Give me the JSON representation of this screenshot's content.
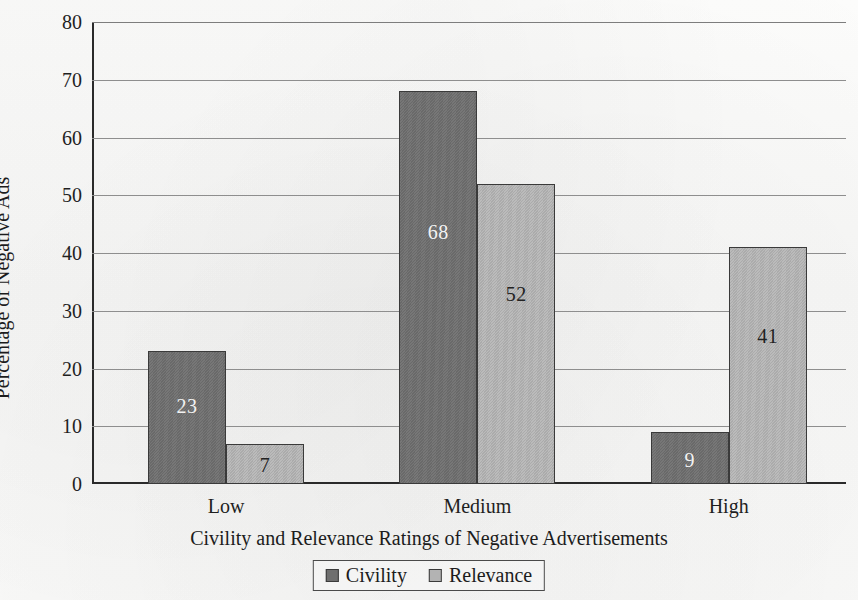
{
  "chart_data": {
    "type": "bar",
    "title": "",
    "xlabel": "Civility and Relevance Ratings of Negative Advertisements",
    "ylabel": "Percentage of Negative Ads",
    "categories": [
      "Low",
      "Medium",
      "High"
    ],
    "series": [
      {
        "name": "Civility",
        "values": [
          23,
          68,
          9
        ],
        "color": "#6f6f6f"
      },
      {
        "name": "Relevance",
        "values": [
          7,
          52,
          41
        ],
        "color": "#b3b3b3"
      }
    ],
    "ylim": [
      0,
      80
    ],
    "ytick_values": [
      0,
      10,
      20,
      30,
      40,
      50,
      60,
      70,
      80
    ],
    "ytick_labels": [
      "0",
      "10",
      "20",
      "30",
      "40",
      "50",
      "60",
      "70",
      "80"
    ],
    "grid": true,
    "grid_axis": "y",
    "legend_position": "bottom",
    "data_labels": {
      "shown": true,
      "Civility": [
        "23",
        "68",
        "9"
      ],
      "Relevance": [
        "7",
        "52",
        "41"
      ]
    }
  },
  "legend": {
    "entries": [
      {
        "label": "Civility"
      },
      {
        "label": "Relevance"
      }
    ]
  }
}
